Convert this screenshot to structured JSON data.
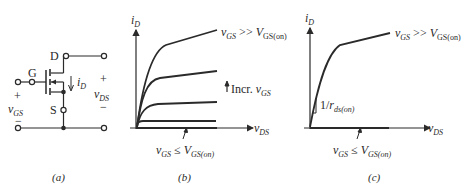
{
  "figure": {
    "panel_a": {
      "caption": "(a)",
      "terminals": {
        "drain": "D",
        "gate": "G",
        "source": "S"
      },
      "current_label": {
        "main": "i",
        "sub": "D"
      },
      "vgs_label": {
        "plus": "+",
        "main": "v",
        "sub": "GS",
        "minus": "−"
      },
      "vds_label": {
        "plus": "+",
        "main": "v",
        "sub": "DS",
        "minus": "−"
      }
    },
    "panel_b": {
      "caption": "(b)",
      "y_axis": {
        "main": "i",
        "sub": "D"
      },
      "x_axis": {
        "main": "v",
        "sub": "DS"
      },
      "top_curve_label": {
        "v": "v",
        "vsub": "GS",
        "op": " >> ",
        "V": "V",
        "Vsub": "GS(on)"
      },
      "incr_label": {
        "text": "Incr. ",
        "v": "v",
        "vsub": "GS"
      },
      "bottom_label": {
        "v": "v",
        "vsub": "GS",
        "op": " ≤ ",
        "V": "V",
        "Vsub": "GS(on)"
      }
    },
    "panel_c": {
      "caption": "(c)",
      "y_axis": {
        "main": "i",
        "sub": "D"
      },
      "x_axis": {
        "main": "v",
        "sub": "DS"
      },
      "top_curve_label": {
        "v": "v",
        "vsub": "GS",
        "op": " >> ",
        "V": "V",
        "Vsub": "GS(on)"
      },
      "slope_label": {
        "prefix": "1/",
        "r": "r",
        "rsub": "ds(on)"
      },
      "bottom_label": {
        "v": "v",
        "vsub": "GS",
        "op": " ≤ ",
        "V": "V",
        "Vsub": "GS(on)"
      }
    },
    "colors": {
      "ink": "#2a2a2a",
      "background": "#ffffff"
    }
  }
}
